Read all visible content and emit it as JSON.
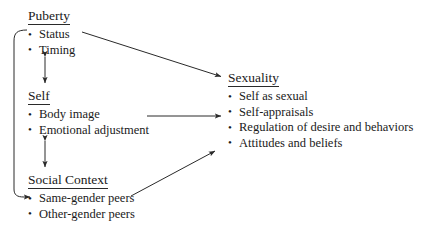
{
  "diagram": {
    "background_color": "#ffffff",
    "line_color": "#2a2a2a",
    "text_color": "#1a1a1a",
    "groups": [
      {
        "id": "puberty",
        "heading": "Puberty",
        "items": [
          "Status",
          "Timing"
        ]
      },
      {
        "id": "self",
        "heading": "Self",
        "items": [
          "Body image",
          "Emotional adjustment"
        ]
      },
      {
        "id": "social_context",
        "heading": "Social Context",
        "items": [
          "Same-gender peers",
          "Other-gender peers"
        ]
      },
      {
        "id": "sexuality",
        "heading": "Sexuality",
        "items": [
          "Self as sexual",
          "Self-appraisals",
          "Regulation of desire and behaviors",
          "Attitudes and beliefs"
        ]
      }
    ],
    "connectors": [
      {
        "id": "puberty-to-sexuality",
        "from": "Puberty",
        "to": "Sexuality",
        "style": "diagonal-arrow",
        "heads": "single"
      },
      {
        "id": "self-to-sexuality",
        "from": "Self",
        "to": "Sexuality",
        "style": "horizontal-arrow",
        "heads": "single"
      },
      {
        "id": "social-context-to-sexuality",
        "from": "Social Context",
        "to": "Sexuality",
        "style": "diagonal-arrow",
        "heads": "single"
      },
      {
        "id": "puberty-self-bidirectional",
        "from": "Puberty",
        "to": "Self",
        "style": "vertical-arrow",
        "heads": "double"
      },
      {
        "id": "self-social-context-bidirectional",
        "from": "Self",
        "to": "Social Context",
        "style": "vertical-arrow",
        "heads": "double"
      },
      {
        "id": "puberty-to-social-context-bracket",
        "from": "Puberty",
        "to": "Social Context",
        "style": "curved-bracket-arrow",
        "heads": "single"
      }
    ]
  }
}
